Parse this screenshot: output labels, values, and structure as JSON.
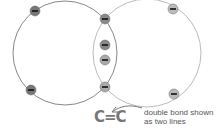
{
  "diagram": {
    "atoms": [
      {
        "name": "left-carbon-shell",
        "cx": 65,
        "cy": 53,
        "r": 52
      },
      {
        "name": "right-carbon-shell",
        "cx": 147,
        "cy": 53,
        "r": 54
      }
    ],
    "electrons": [
      {
        "x": 35,
        "y": 11,
        "shade": "#777"
      },
      {
        "x": 31,
        "y": 90,
        "shade": "#777"
      },
      {
        "x": 105,
        "y": 19,
        "shade": "#888"
      },
      {
        "x": 105,
        "y": 45,
        "shade": "#888"
      },
      {
        "x": 105,
        "y": 60,
        "shade": "#aaa"
      },
      {
        "x": 105,
        "y": 87,
        "shade": "#aaa"
      },
      {
        "x": 173,
        "y": 9,
        "shade": "#bbb"
      },
      {
        "x": 174,
        "y": 94,
        "shade": "#bbb"
      }
    ],
    "electron_symbol": "−",
    "formula": "C=C",
    "annotation": {
      "line1": "double bond shown",
      "line2": "as two lines"
    }
  }
}
